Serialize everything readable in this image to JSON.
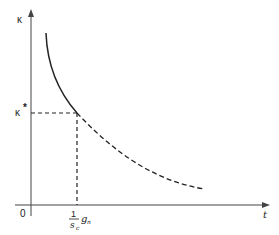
{
  "diagram": {
    "y_axis_label": "κ",
    "x_axis_label": "t",
    "origin_label": "0",
    "marked_y_value_label": "κ",
    "marked_y_value_superscript": "*",
    "marked_x_value": {
      "numerator": "1",
      "denominator": "s",
      "denominator_subscript": "c",
      "factor": "g",
      "factor_subscript": "n"
    },
    "curves": [
      {
        "name": "solid-curve",
        "style": "solid",
        "description": "decreasing convex curve from top down to κ* at t = g_n/s_c"
      },
      {
        "name": "dashed-curve",
        "style": "dashed",
        "description": "continuation of the decreasing curve beyond t = g_n/s_c"
      }
    ],
    "guides": [
      {
        "name": "horizontal-guide",
        "style": "dashed",
        "description": "horizontal dashed line from y-axis at κ* to curve"
      },
      {
        "name": "vertical-guide",
        "style": "dashed",
        "description": "vertical dashed line from curve to x-axis at g_n/s_c"
      }
    ],
    "colors": {
      "stroke": "#222222",
      "background": "#ffffff"
    }
  }
}
